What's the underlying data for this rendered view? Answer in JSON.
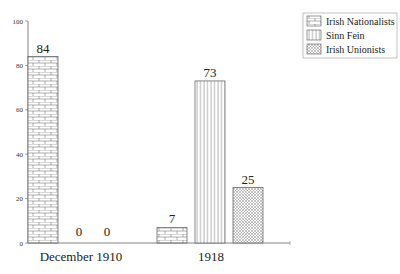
{
  "chart_data": {
    "type": "bar",
    "title": "",
    "xlabel": "",
    "ylabel": "",
    "categories": [
      "December 1910",
      "1918"
    ],
    "series": [
      {
        "name": "Irish Nationalists",
        "values": [
          84,
          7
        ],
        "pattern": "brick"
      },
      {
        "name": "Sinn Fein",
        "values": [
          0,
          73
        ],
        "pattern": "vertical-lines"
      },
      {
        "name": "Irish Unionists",
        "values": [
          0,
          25
        ],
        "pattern": "crosshatch"
      }
    ],
    "value_labels": [
      [
        "84",
        "0",
        "0"
      ],
      [
        "7",
        "73",
        "25"
      ]
    ],
    "ylim": [
      0,
      100
    ],
    "yticks": [
      0,
      20,
      40,
      60,
      80,
      100
    ],
    "ytick_labels": [
      "0",
      "20",
      "40",
      "60",
      "80",
      "100"
    ],
    "grid": false,
    "legend_position": "top-right"
  },
  "legend": {
    "items": [
      {
        "label": "Irish Nationalists"
      },
      {
        "label": "Sinn Fein"
      },
      {
        "label": "Irish Unionists"
      }
    ]
  },
  "colors": {
    "stroke": "#555555",
    "background": "#ffffff"
  }
}
